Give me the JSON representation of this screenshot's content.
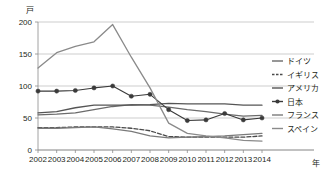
{
  "chart_data": {
    "type": "line",
    "title": "",
    "xlabel": "年",
    "ylabel": "戸",
    "x": [
      2002,
      2003,
      2004,
      2005,
      2006,
      2007,
      2008,
      2009,
      2010,
      2011,
      2012,
      2013,
      2014
    ],
    "xtick_labels": [
      "2002",
      "2003",
      "2004",
      "2005",
      "2006",
      "2007",
      "2008",
      "2009",
      "2010",
      "2011",
      "2012",
      "2013",
      "2014"
    ],
    "ytick_labels": [
      "0",
      "50",
      "100",
      "150",
      "200"
    ],
    "yticks": [
      0,
      50,
      100,
      150,
      200
    ],
    "ylim": [
      0,
      200
    ],
    "grid": true,
    "legend_position": "right",
    "series": [
      {
        "name": "ドイツ",
        "style": "solid",
        "marker": "none",
        "color": "#6b6b6b",
        "values": [
          55,
          56,
          58,
          63,
          68,
          71,
          70,
          67,
          63,
          60,
          56,
          53,
          54
        ]
      },
      {
        "name": "イギリス",
        "style": "dashed",
        "marker": "none",
        "color": "#4a4a4a",
        "values": [
          35,
          35,
          36,
          36,
          36,
          34,
          30,
          21,
          20,
          20,
          20,
          20,
          22
        ]
      },
      {
        "name": "アメリカ",
        "style": "solid",
        "marker": "none",
        "color": "#555555",
        "values": [
          58,
          60,
          66,
          70,
          70,
          70,
          71,
          73,
          72,
          72,
          72,
          70,
          70
        ]
      },
      {
        "name": "日本",
        "style": "solid",
        "marker": "circle",
        "color": "#3a3a3a",
        "values": [
          92,
          92,
          93,
          97,
          100,
          84,
          87,
          63,
          46,
          47,
          57,
          47,
          50
        ]
      },
      {
        "name": "フランス",
        "style": "solid",
        "marker": "none",
        "color": "#7a7a7a",
        "values": [
          34,
          34,
          35,
          36,
          33,
          29,
          22,
          19,
          20,
          21,
          22,
          24,
          26
        ]
      },
      {
        "name": "スペイン",
        "style": "solid",
        "marker": "none",
        "color": "#8a8a8a",
        "values": [
          128,
          152,
          162,
          169,
          196,
          145,
          97,
          42,
          26,
          22,
          19,
          15,
          14
        ]
      }
    ]
  },
  "legend": {
    "items": [
      {
        "label": "ドイツ"
      },
      {
        "label": "イギリス"
      },
      {
        "label": "アメリカ"
      },
      {
        "label": "日本"
      },
      {
        "label": "フランス"
      },
      {
        "label": "スペイン"
      }
    ]
  },
  "axes": {
    "y_unit": "戸",
    "x_unit": "年"
  }
}
